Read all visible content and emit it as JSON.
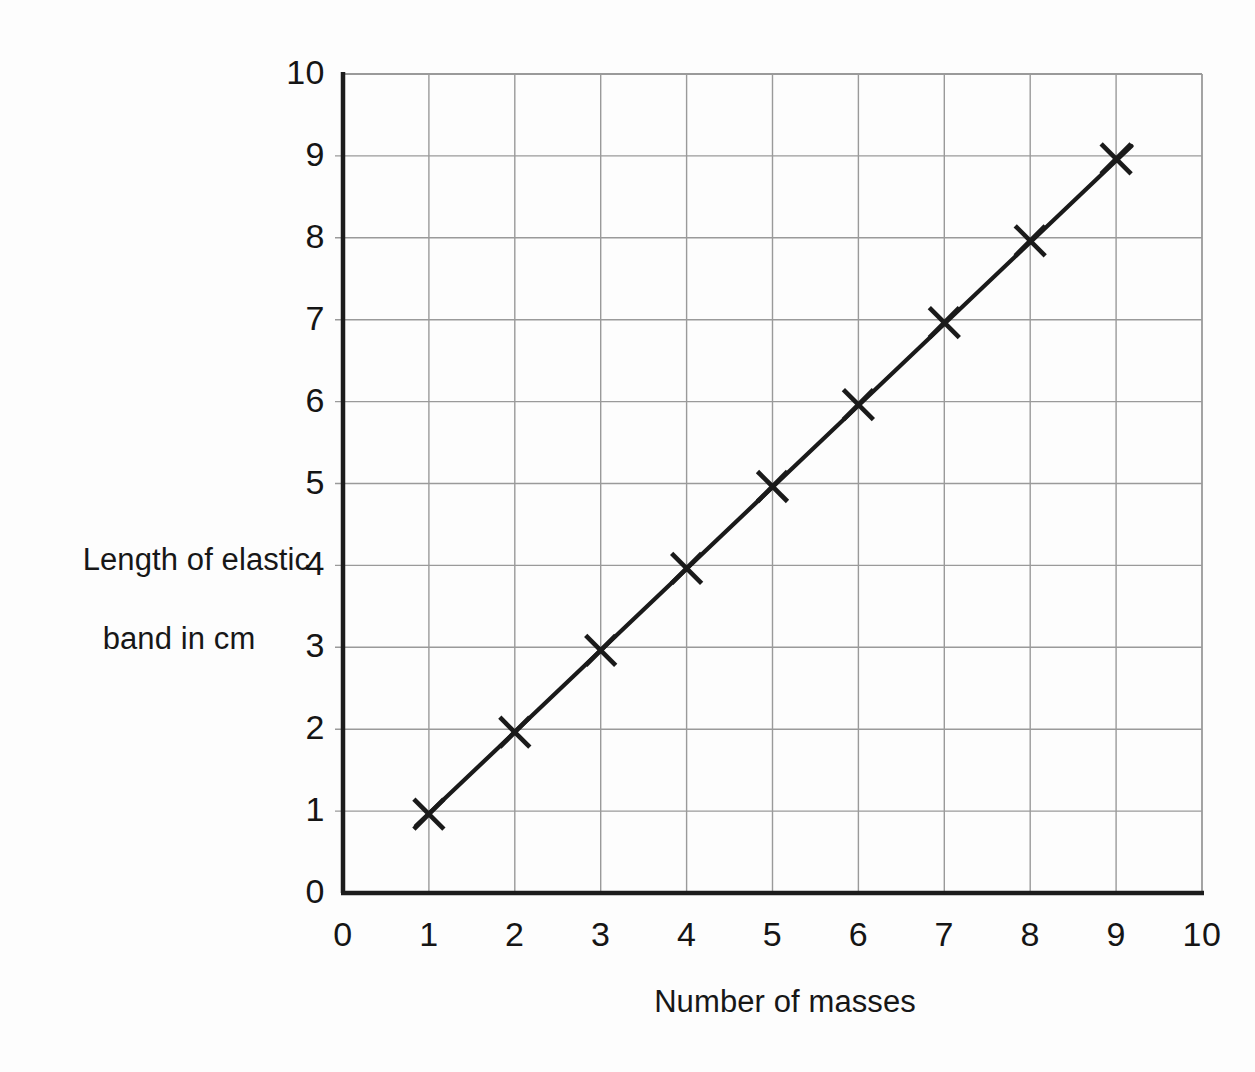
{
  "chart_data": {
    "type": "line",
    "title": "",
    "xlabel": "Number of masses",
    "ylabel_line1": "Length of elastic",
    "ylabel_line2": "band in cm",
    "ylabel": "Length of elastic band in cm",
    "xlim": [
      0,
      10
    ],
    "ylim": [
      0,
      10
    ],
    "xticks": [
      "0",
      "1",
      "2",
      "3",
      "4",
      "5",
      "6",
      "7",
      "8",
      "9",
      "10"
    ],
    "yticks": [
      "0",
      "1",
      "2",
      "3",
      "4",
      "5",
      "6",
      "7",
      "8",
      "9",
      "10"
    ],
    "grid": true,
    "legend": "none",
    "marker": "x-cross",
    "x": [
      1,
      2,
      3,
      4,
      5,
      6,
      7,
      8,
      9
    ],
    "values": [
      1,
      2,
      3,
      4,
      5,
      6,
      7,
      8,
      9
    ],
    "series": [
      {
        "name": "Length of elastic band",
        "points": [
          {
            "x": 1,
            "y": 1
          },
          {
            "x": 2,
            "y": 2
          },
          {
            "x": 3,
            "y": 3
          },
          {
            "x": 4,
            "y": 4
          },
          {
            "x": 5,
            "y": 5
          },
          {
            "x": 6,
            "y": 6
          },
          {
            "x": 7,
            "y": 7
          },
          {
            "x": 8,
            "y": 8
          },
          {
            "x": 9,
            "y": 9
          }
        ]
      }
    ],
    "line_of_best_fit": {
      "from": {
        "x": 0.85,
        "y": 0.82
      },
      "to": {
        "x": 9.18,
        "y": 9.12
      }
    },
    "colors": {
      "axis": "#1c1c1c",
      "grid": "#9a9a9a",
      "data": "#1a1a1a",
      "background": "#fdfdfd",
      "text": "#171717"
    }
  }
}
